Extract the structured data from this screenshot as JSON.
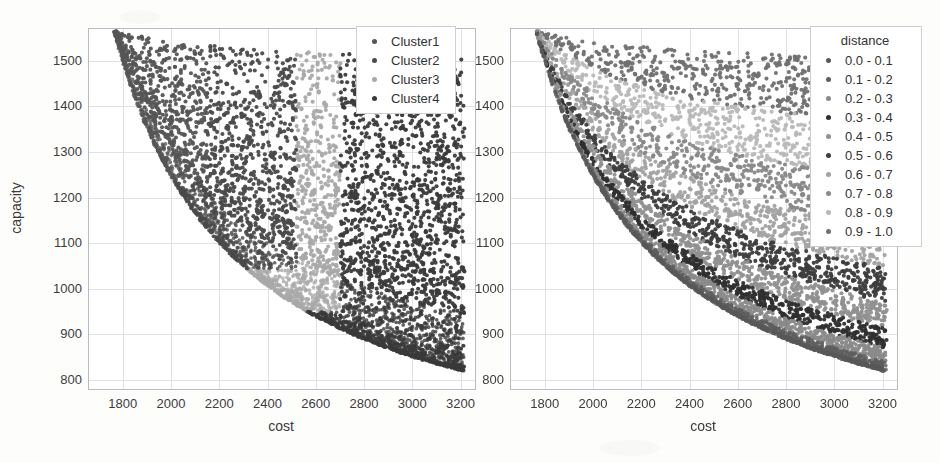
{
  "figure": {
    "background_color": "#fdfdfc",
    "panel_count": 2,
    "style": "grayscale scanned scatter plot"
  },
  "chart_data": [
    {
      "id": "left-panel",
      "type": "scatter",
      "title": "",
      "xlabel": "cost",
      "ylabel": "capacity",
      "xlim": [
        1660,
        3260
      ],
      "ylim": [
        780,
        1570
      ],
      "xticks": [
        1800,
        2000,
        2200,
        2400,
        2600,
        2800,
        3000,
        3200
      ],
      "yticks": [
        800,
        900,
        1000,
        1100,
        1200,
        1300,
        1400,
        1500
      ],
      "grid": true,
      "grid_color": "#dfe2e5",
      "legend_title": "",
      "legend_position": "upper right",
      "series": [
        {
          "name": "Cluster1",
          "color": "#555555",
          "n_points": 1450,
          "region": "upper-left dense band, cost 1700-2150, capacity 1250-1560",
          "cost_range": [
            1690,
            2400
          ],
          "capacity_range": [
            1190,
            1565
          ]
        },
        {
          "name": "Cluster2",
          "color": "#4a4a4a",
          "n_points": 1500,
          "region": "middle-upper band, cost 1700-2500, capacity 1050-1500",
          "cost_range": [
            1700,
            2500
          ],
          "capacity_range": [
            1030,
            1500
          ]
        },
        {
          "name": "Cluster3",
          "color": "#a9a9a9",
          "n_points": 1350,
          "region": "middle band, cost 2000-2650, capacity 960-1230",
          "cost_range": [
            1960,
            2700
          ],
          "capacity_range": [
            950,
            1240
          ]
        },
        {
          "name": "Cluster4",
          "color": "#3a3a3a",
          "n_points": 1300,
          "region": "lower-right tail, cost 2450-3230, capacity 810-1050",
          "cost_range": [
            2450,
            3235
          ],
          "capacity_range": [
            805,
            1060
          ]
        }
      ],
      "shape_note": "Points fill a convex Pareto-style crescent decreasing from (1700,1560) to (3200,820)"
    },
    {
      "id": "right-panel",
      "type": "scatter",
      "title": "",
      "xlabel": "cost",
      "ylabel": "",
      "xlim": [
        1660,
        3260
      ],
      "ylim": [
        780,
        1570
      ],
      "xticks": [
        1800,
        2000,
        2200,
        2400,
        2600,
        2800,
        3000,
        3200
      ],
      "yticks": [
        800,
        900,
        1000,
        1100,
        1200,
        1300,
        1400,
        1500
      ],
      "grid": true,
      "grid_color": "#dfe2e5",
      "legend_title": "distance",
      "legend_position": "upper right",
      "series": [
        {
          "name": "0.0 - 0.1",
          "color": "#585858",
          "n_points": 560,
          "band": 0
        },
        {
          "name": "0.1 - 0.2",
          "color": "#5e5e5e",
          "n_points": 560,
          "band": 1
        },
        {
          "name": "0.2 - 0.3",
          "color": "#8a8a8a",
          "n_points": 560,
          "band": 2
        },
        {
          "name": "0.3 - 0.4",
          "color": "#2f2f2f",
          "n_points": 560,
          "band": 3
        },
        {
          "name": "0.4 - 0.5",
          "color": "#909090",
          "n_points": 560,
          "band": 4
        },
        {
          "name": "0.5 - 0.6",
          "color": "#3d3d3d",
          "n_points": 560,
          "band": 5
        },
        {
          "name": "0.6 - 0.7",
          "color": "#a2a2a2",
          "n_points": 560,
          "band": 6
        },
        {
          "name": "0.7 - 0.8",
          "color": "#888888",
          "n_points": 560,
          "band": 7
        },
        {
          "name": "0.8 - 0.9",
          "color": "#b8b8b8",
          "n_points": 560,
          "band": 8
        },
        {
          "name": "0.9 - 1.0",
          "color": "#707070",
          "n_points": 560,
          "band": 9
        }
      ],
      "shape_note": "Same crescent cloud, colored by normalized distance from the Pareto front in concentric arc bands"
    }
  ],
  "left_panel": {
    "ylabel": "capacity",
    "xlabel": "cost",
    "yticks": [
      "1500",
      "1400",
      "1300",
      "1200",
      "1100",
      "1000",
      "900",
      "800"
    ],
    "xticks": [
      "1800",
      "2000",
      "2200",
      "2400",
      "2600",
      "2800",
      "3000",
      "3200"
    ],
    "legend": {
      "title": "",
      "items": [
        {
          "label": "Cluster1",
          "color": "#555555"
        },
        {
          "label": "Cluster2",
          "color": "#4a4a4a"
        },
        {
          "label": "Cluster3",
          "color": "#a9a9a9"
        },
        {
          "label": "Cluster4",
          "color": "#3a3a3a"
        }
      ]
    }
  },
  "right_panel": {
    "ylabel": "",
    "xlabel": "cost",
    "yticks": [
      "1500",
      "1400",
      "1300",
      "1200",
      "1100",
      "1000",
      "900",
      "800"
    ],
    "xticks": [
      "1800",
      "2000",
      "2200",
      "2400",
      "2600",
      "2800",
      "3000",
      "3200"
    ],
    "legend": {
      "title": "distance",
      "items": [
        {
          "label": "0.0 - 0.1",
          "color": "#585858"
        },
        {
          "label": "0.1 - 0.2",
          "color": "#5e5e5e"
        },
        {
          "label": "0.2 - 0.3",
          "color": "#8a8a8a"
        },
        {
          "label": "0.3 - 0.4",
          "color": "#2f2f2f"
        },
        {
          "label": "0.4 - 0.5",
          "color": "#909090"
        },
        {
          "label": "0.5 - 0.6",
          "color": "#3d3d3d"
        },
        {
          "label": "0.6 - 0.7",
          "color": "#a2a2a2"
        },
        {
          "label": "0.7 - 0.8",
          "color": "#888888"
        },
        {
          "label": "0.8 - 0.9",
          "color": "#b8b8b8"
        },
        {
          "label": "0.9 - 1.0",
          "color": "#707070"
        }
      ]
    }
  }
}
